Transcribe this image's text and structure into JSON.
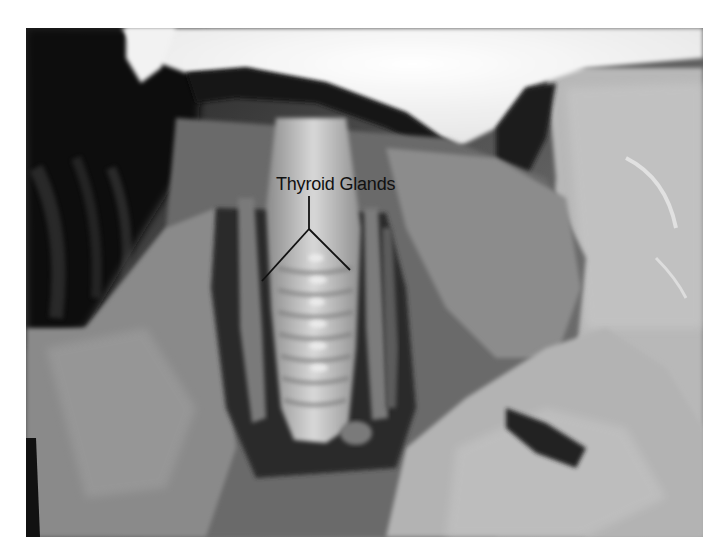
{
  "image": {
    "description": "Grayscale photograph of a dissected neck region showing the trachea with cartilage rings and flanking thyroid glands",
    "frame": {
      "x": 26,
      "y": 28,
      "width": 677,
      "height": 509
    },
    "background_color": "#ffffff"
  },
  "annotation": {
    "label": "Thyroid Glands",
    "label_color": "#111111",
    "pointer": {
      "stem": {
        "from": [
          309,
          196
        ],
        "to": [
          309,
          229
        ]
      },
      "left_branch": {
        "from": [
          309,
          229
        ],
        "to": [
          262,
          281
        ]
      },
      "right_branch": {
        "from": [
          309,
          229
        ],
        "to": [
          350,
          270
        ]
      }
    }
  }
}
